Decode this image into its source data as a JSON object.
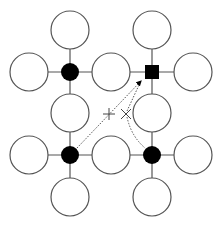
{
  "diagram": {
    "width": 221,
    "height": 227,
    "colors": {
      "stroke": "#555555",
      "fill_dark": "#000000",
      "fill_light": "#ffffff",
      "marker": "#444444"
    },
    "hubs": [
      {
        "id": "hub-top-left",
        "shape": "circle",
        "x": 70,
        "y": 72,
        "r": 9
      },
      {
        "id": "hub-top-right",
        "shape": "square",
        "x": 152,
        "y": 72,
        "size": 14
      },
      {
        "id": "hub-bottom-left",
        "shape": "circle",
        "x": 70,
        "y": 155,
        "r": 9
      },
      {
        "id": "hub-bottom-right",
        "shape": "circle",
        "x": 152,
        "y": 155,
        "r": 9
      }
    ],
    "nodes": [
      {
        "x": 70,
        "y": 30
      },
      {
        "x": 29,
        "y": 72
      },
      {
        "x": 111,
        "y": 72
      },
      {
        "x": 70,
        "y": 113
      },
      {
        "x": 152,
        "y": 30
      },
      {
        "x": 193,
        "y": 72
      },
      {
        "x": 152,
        "y": 113
      },
      {
        "x": 29,
        "y": 155
      },
      {
        "x": 111,
        "y": 155
      },
      {
        "x": 70,
        "y": 197
      },
      {
        "x": 193,
        "y": 155
      },
      {
        "x": 152,
        "y": 197
      }
    ],
    "node_radius": 19,
    "markers": [
      {
        "type": "plus",
        "x": 109,
        "y": 114
      },
      {
        "type": "cross",
        "x": 126,
        "y": 114
      }
    ]
  }
}
